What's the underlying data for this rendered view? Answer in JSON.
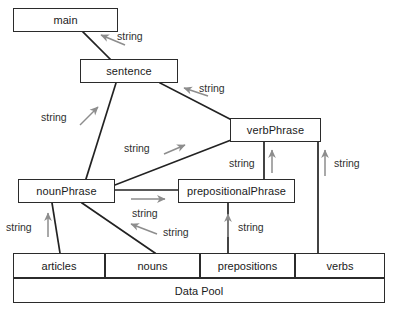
{
  "diagram": {
    "type": "blackboard-architecture-diagram",
    "colors": {
      "background": "#ffffff",
      "box_border": "#2b2b2b",
      "box_fill": "#ffffff",
      "connector_line": "#222222",
      "arrow_gray": "#8d8d8d",
      "text": "#1a1a1a"
    },
    "nodes": [
      {
        "id": "main",
        "label": "main",
        "x": 13,
        "y": 8,
        "w": 105,
        "h": 24
      },
      {
        "id": "sentence",
        "label": "sentence",
        "x": 80,
        "y": 59,
        "w": 98,
        "h": 24
      },
      {
        "id": "verbPhrase",
        "label": "verbPhrase",
        "x": 230,
        "y": 118,
        "w": 91,
        "h": 24
      },
      {
        "id": "nounPhrase",
        "label": "nounPhrase",
        "x": 18,
        "y": 179,
        "w": 97,
        "h": 24
      },
      {
        "id": "prepositionalPhrase",
        "label": "prepositionalPhrase",
        "x": 178,
        "y": 179,
        "w": 117,
        "h": 24
      }
    ],
    "pool": {
      "cells": [
        {
          "id": "articles",
          "label": "articles",
          "x": 13,
          "y": 253,
          "w": 92,
          "h": 25
        },
        {
          "id": "nouns",
          "label": "nouns",
          "x": 105,
          "y": 253,
          "w": 95,
          "h": 25
        },
        {
          "id": "prepositions",
          "label": "prepositions",
          "x": 200,
          "y": 253,
          "w": 95,
          "h": 25
        },
        {
          "id": "verbs",
          "label": "verbs",
          "x": 295,
          "y": 253,
          "w": 90,
          "h": 25
        }
      ],
      "base": {
        "id": "data-pool",
        "label": "Data Pool",
        "x": 13,
        "y": 278,
        "w": 372,
        "h": 25
      }
    },
    "edges": [
      {
        "id": "sentence-to-main",
        "from": "sentence",
        "to": "main",
        "label": "string"
      },
      {
        "id": "verbphrase-to-sentence",
        "from": "verbPhrase",
        "to": "sentence",
        "label": "string"
      },
      {
        "id": "nounphrase-to-sentence",
        "from": "nounPhrase",
        "to": "sentence",
        "label": "string"
      },
      {
        "id": "nounphrase-to-verbphrase",
        "from": "nounPhrase",
        "to": "verbPhrase",
        "label": "string"
      },
      {
        "id": "prepositionalphrase-to-verbphrase",
        "from": "prepositionalPhrase",
        "to": "verbPhrase",
        "label": "string"
      },
      {
        "id": "verbs-to-verbphrase",
        "from": "verbs",
        "to": "verbPhrase",
        "label": "string"
      },
      {
        "id": "nounphrase-to-prepositionalphrase",
        "from": "nounPhrase",
        "to": "prepositionalPhrase",
        "label": "string"
      },
      {
        "id": "nouns-to-nounphrase",
        "from": "nouns",
        "to": "nounPhrase",
        "label": "string"
      },
      {
        "id": "articles-to-nounphrase",
        "from": "articles",
        "to": "nounPhrase",
        "label": "string"
      },
      {
        "id": "prepositions-to-prepositionalphrase",
        "from": "prepositions",
        "to": "prepositionalPhrase",
        "label": "string"
      }
    ],
    "labels": [
      {
        "id": "label-sentence-main",
        "text": "string",
        "x": 117,
        "y": 30
      },
      {
        "id": "label-verbphrase-sentence",
        "text": "string",
        "x": 199,
        "y": 82
      },
      {
        "id": "label-nounphrase-sentence",
        "text": "string",
        "x": 41,
        "y": 111
      },
      {
        "id": "label-nounphrase-verbphrase",
        "text": "string",
        "x": 124,
        "y": 142
      },
      {
        "id": "label-prepphrase-verbphrase",
        "text": "string",
        "x": 229,
        "y": 157
      },
      {
        "id": "label-verbs-verbphrase",
        "text": "string",
        "x": 334,
        "y": 157
      },
      {
        "id": "label-np-to-pp",
        "text": "string",
        "x": 132,
        "y": 207
      },
      {
        "id": "label-nouns-np",
        "text": "string",
        "x": 163,
        "y": 226
      },
      {
        "id": "label-prepositions-pp",
        "text": "string",
        "x": 238,
        "y": 221
      },
      {
        "id": "label-articles-np",
        "text": "string",
        "x": 6,
        "y": 221
      }
    ]
  }
}
